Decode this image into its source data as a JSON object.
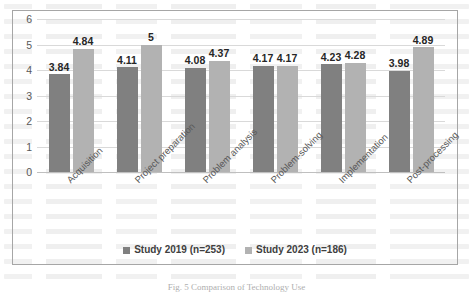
{
  "chart_data": {
    "type": "bar",
    "title": "",
    "xlabel": "",
    "ylabel": "",
    "ylim": [
      0,
      6
    ],
    "yticks": [
      0,
      1,
      2,
      3,
      4,
      5,
      6
    ],
    "grid": true,
    "legend_position": "bottom",
    "categories": [
      "Acquisition",
      "Project preparation",
      "Problem analysis",
      "Problem-solving",
      "Implementation",
      "Post-processing"
    ],
    "series": [
      {
        "name": "Study 2019 (n=253)",
        "color": "#808080",
        "values": [
          3.84,
          4.11,
          4.08,
          4.17,
          4.23,
          3.98
        ],
        "labels": [
          "3.84",
          "4.11",
          "4.08",
          "4.17",
          "4.23",
          "3.98"
        ]
      },
      {
        "name": "Study 2023 (n=186)",
        "color": "#b2b2b2",
        "values": [
          4.84,
          5,
          4.37,
          4.17,
          4.28,
          4.89
        ],
        "labels": [
          "4.84",
          "5",
          "4.37",
          "4.17",
          "4.28",
          "4.89"
        ]
      }
    ]
  },
  "caption": "Fig. 5   Comparison of Technology Use"
}
